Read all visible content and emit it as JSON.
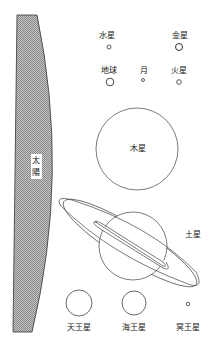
{
  "diagram": {
    "title": "",
    "colors": {
      "stroke": "#333333",
      "sun_fill": "#b8b8b8",
      "background": "#ffffff"
    },
    "sun": {
      "label": "太陽",
      "label_chars": [
        "太",
        "陽"
      ]
    },
    "planets": [
      {
        "id": "mercury",
        "label": "水星",
        "cx": 107,
        "cy": 47,
        "r": 2
      },
      {
        "id": "venus",
        "label": "金星",
        "cx": 179,
        "cy": 47,
        "r": 4
      },
      {
        "id": "earth",
        "label": "地球",
        "cx": 110,
        "cy": 82,
        "r": 4.5
      },
      {
        "id": "moon",
        "label": "月",
        "cx": 143,
        "cy": 80,
        "r": 1.5
      },
      {
        "id": "mars",
        "label": "火星",
        "cx": 179,
        "cy": 82,
        "r": 2.5
      },
      {
        "id": "jupiter",
        "label": "木星",
        "cx": 137,
        "cy": 149,
        "r": 41
      },
      {
        "id": "saturn",
        "label": "土星",
        "cx": 133,
        "cy": 246,
        "r": 34
      },
      {
        "id": "uranus",
        "label": "天王星",
        "cx": 79,
        "cy": 303,
        "r": 13
      },
      {
        "id": "neptune",
        "label": "海王星",
        "cx": 134,
        "cy": 303,
        "r": 12
      },
      {
        "id": "pluto",
        "label": "冥王星",
        "cx": 188,
        "cy": 304,
        "r": 2
      }
    ]
  }
}
